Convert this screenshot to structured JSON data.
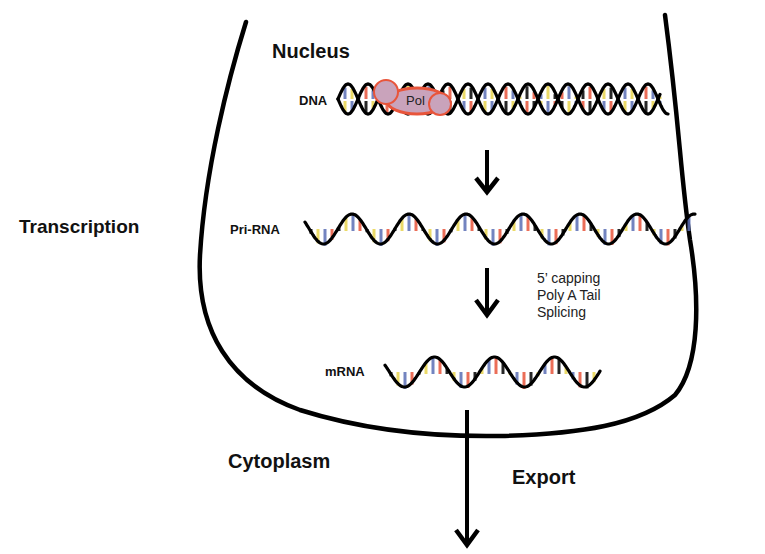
{
  "diagram": {
    "title": "Transcription",
    "regions": {
      "nucleus": "Nucleus",
      "cytoplasm": "Cytoplasm"
    },
    "molecules": {
      "dna": "DNA",
      "pri_rna": "Pri-RNA",
      "mrna": "mRNA"
    },
    "enzyme": "Pol",
    "processing_steps": [
      "5’ capping",
      "Poly A Tail",
      "Splicing"
    ],
    "export_label": "Export",
    "colors": {
      "outline": "#000000",
      "base_red": "#e8553b",
      "base_blue": "#5a6fb5",
      "base_yellow": "#e8d44d",
      "pol_fill": "#c9a3bb",
      "pol_stroke": "#e8553b"
    }
  }
}
